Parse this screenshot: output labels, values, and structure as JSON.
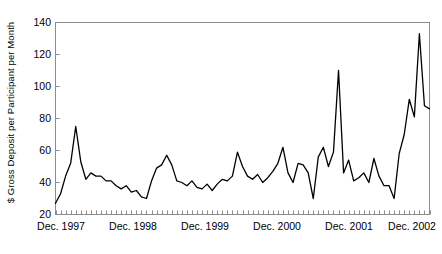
{
  "chart_data": {
    "type": "line",
    "title": "",
    "xlabel": "",
    "ylabel": "$ Gross Deposit per Participant per Month",
    "ylim": [
      20,
      140
    ],
    "ytick_labels": [
      "20",
      "40",
      "60",
      "80",
      "100",
      "120",
      "140"
    ],
    "ytick_values": [
      20,
      40,
      60,
      80,
      100,
      120,
      140
    ],
    "xtick_labels": [
      "Dec. 1997",
      "Dec. 1998",
      "Dec. 1999",
      "Dec. 2000",
      "Dec. 2001",
      "Dec. 2002"
    ],
    "xtick_values": [
      0,
      12,
      24,
      36,
      48,
      60
    ],
    "grid": false,
    "legend": null,
    "line_color": "#000000",
    "axis_color": "#808080",
    "x": [
      0,
      1,
      2,
      3,
      4,
      5,
      6,
      7,
      8,
      9,
      10,
      11,
      12,
      13,
      14,
      15,
      16,
      17,
      18,
      19,
      20,
      21,
      22,
      23,
      24,
      25,
      26,
      27,
      28,
      29,
      30,
      31,
      32,
      33,
      34,
      35,
      36,
      37,
      38,
      39,
      40,
      41,
      42,
      43,
      44,
      45,
      46,
      47,
      48,
      49,
      50,
      51,
      52,
      53,
      54,
      55,
      56,
      57,
      58,
      59,
      60,
      61,
      62
    ],
    "values": [
      27,
      33,
      44,
      52,
      75,
      53,
      42,
      46,
      44,
      44,
      41,
      41,
      38,
      36,
      38,
      34,
      35,
      31,
      30,
      41,
      49,
      51,
      57,
      51,
      41,
      40,
      38,
      41,
      37,
      36,
      39,
      35,
      39,
      42,
      41,
      44,
      59,
      50,
      44,
      42,
      45,
      40,
      43,
      47,
      52,
      62,
      46,
      40,
      52,
      51,
      46,
      30,
      56,
      62,
      50,
      59,
      110,
      46,
      54,
      41,
      43,
      46,
      40
    ],
    "series_name": "Gross deposit per participant per month",
    "point_count": 63,
    "peak_values": [
      75,
      110,
      133
    ],
    "min_value": 27,
    "max_value": 133
  },
  "chart_series_full": {
    "values": [
      27,
      33,
      44,
      52,
      75,
      53,
      42,
      46,
      44,
      44,
      41,
      41,
      38,
      36,
      38,
      34,
      35,
      31,
      30,
      41,
      49,
      51,
      57,
      51,
      41,
      40,
      38,
      41,
      37,
      36,
      39,
      35,
      39,
      42,
      41,
      44,
      59,
      50,
      44,
      42,
      45,
      40,
      43,
      47,
      52,
      62,
      46,
      40,
      52,
      51,
      46,
      30,
      56,
      62,
      50,
      59,
      110,
      46,
      54,
      41,
      43,
      46,
      40,
      55,
      44,
      38,
      38,
      30,
      58,
      70,
      92,
      81,
      133,
      88,
      86
    ]
  }
}
